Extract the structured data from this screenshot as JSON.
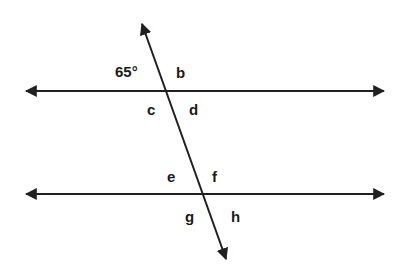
{
  "diagram": {
    "type": "parallel-lines-transversal",
    "background_color": "#ffffff",
    "stroke_color": "#231f20",
    "text_color": "#1a1a1a",
    "stroke_width": 2,
    "canvas": {
      "width": 411,
      "height": 278
    },
    "lines": [
      {
        "name": "upper-parallel-line",
        "kind": "double-headed-arrow",
        "x1": 22,
        "y1": 91,
        "x2": 388,
        "y2": 91
      },
      {
        "name": "lower-parallel-line",
        "kind": "double-headed-arrow",
        "x1": 22,
        "y1": 194,
        "x2": 388,
        "y2": 194
      },
      {
        "name": "transversal-line",
        "kind": "double-headed-arrow",
        "x1": 140,
        "y1": 18,
        "x2": 228,
        "y2": 265
      }
    ],
    "intersections": [
      {
        "name": "upper-intersection",
        "x": 168,
        "y": 91
      },
      {
        "name": "lower-intersection",
        "x": 203,
        "y": 194
      }
    ],
    "labels": [
      {
        "id": "angle-65",
        "text": "65°",
        "x": 115,
        "y": 64,
        "kind": "measure",
        "position": "upper-left-of-upper-intersection"
      },
      {
        "id": "angle-b",
        "text": "b",
        "x": 176,
        "y": 65,
        "kind": "letter",
        "position": "upper-right-of-upper-intersection"
      },
      {
        "id": "angle-c",
        "text": "c",
        "x": 147,
        "y": 102,
        "kind": "letter",
        "position": "lower-left-of-upper-intersection"
      },
      {
        "id": "angle-d",
        "text": "d",
        "x": 189,
        "y": 102,
        "kind": "letter",
        "position": "lower-right-of-upper-intersection"
      },
      {
        "id": "angle-e",
        "text": "e",
        "x": 167,
        "y": 169,
        "kind": "letter",
        "position": "upper-left-of-lower-intersection"
      },
      {
        "id": "angle-f",
        "text": "f",
        "x": 212,
        "y": 169,
        "kind": "letter",
        "position": "upper-right-of-lower-intersection"
      },
      {
        "id": "angle-g",
        "text": "g",
        "x": 185,
        "y": 209,
        "kind": "letter",
        "position": "lower-left-of-lower-intersection"
      },
      {
        "id": "angle-h",
        "text": "h",
        "x": 231,
        "y": 209,
        "kind": "letter",
        "position": "lower-right-of-lower-intersection"
      }
    ]
  }
}
